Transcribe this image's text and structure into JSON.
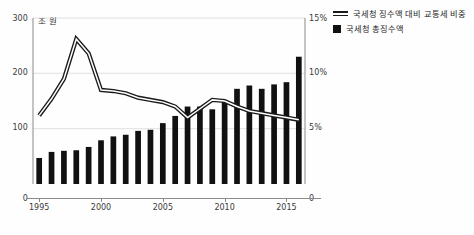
{
  "chart_data": {
    "type": "bar",
    "title": "",
    "xlabel": "",
    "ylabel": "조 원",
    "ylabel_right": "%",
    "unit_note": "조 원",
    "x": [
      1995,
      1996,
      1997,
      1998,
      1999,
      2000,
      2001,
      2002,
      2003,
      2004,
      2005,
      2006,
      2007,
      2008,
      2009,
      2010,
      2011,
      2012,
      2013,
      2014,
      2015,
      2016
    ],
    "xtick_labels": [
      "1995",
      "2000",
      "2005",
      "2010",
      "2015"
    ],
    "xtick_values": [
      1995,
      2000,
      2005,
      2010,
      2015
    ],
    "ylim": [
      0,
      300
    ],
    "yticks": [
      0,
      100,
      200,
      300
    ],
    "ytick_labels": [
      "0",
      "100",
      "200",
      "300"
    ],
    "ylim_right": [
      0,
      15
    ],
    "yticks_right": [
      0,
      5,
      10,
      15
    ],
    "ytick_labels_right": [
      "0",
      "5%",
      "10%",
      "15%"
    ],
    "grid": true,
    "legend_position": "top-right",
    "series": [
      {
        "name": "국세청 총징수액",
        "type": "bar",
        "axis": "left",
        "color": "#111111",
        "values": [
          47,
          58,
          60,
          61,
          67,
          79,
          86,
          89,
          96,
          98,
          110,
          123,
          140,
          140,
          135,
          151,
          172,
          178,
          172,
          180,
          184,
          230
        ]
      },
      {
        "name": "국세청 징수액 대비 교통세 비중",
        "type": "line",
        "axis": "right",
        "color": "#1a1a1a",
        "values": [
          6.2,
          7.7,
          9.5,
          13.1,
          11.8,
          8.5,
          8.4,
          8.2,
          7.8,
          7.6,
          7.4,
          7.0,
          6.0,
          6.8,
          7.6,
          7.5,
          7.0,
          6.6,
          6.4,
          6.2,
          6.0,
          5.8
        ]
      }
    ]
  },
  "legend": {
    "items": [
      {
        "label": "국세청 징수액 대비 교통세 비중",
        "marker": "double-line"
      },
      {
        "label": "국세청 총징수액",
        "marker": "filled-square"
      }
    ]
  },
  "axes": {
    "unit_left": "조 원",
    "left_ticks": [
      "300",
      "200",
      "100",
      "0"
    ],
    "right_ticks": [
      "15%",
      "10%",
      "5%",
      "0"
    ],
    "x_ticks": [
      "1995",
      "2000",
      "2005",
      "2010",
      "2015"
    ]
  }
}
